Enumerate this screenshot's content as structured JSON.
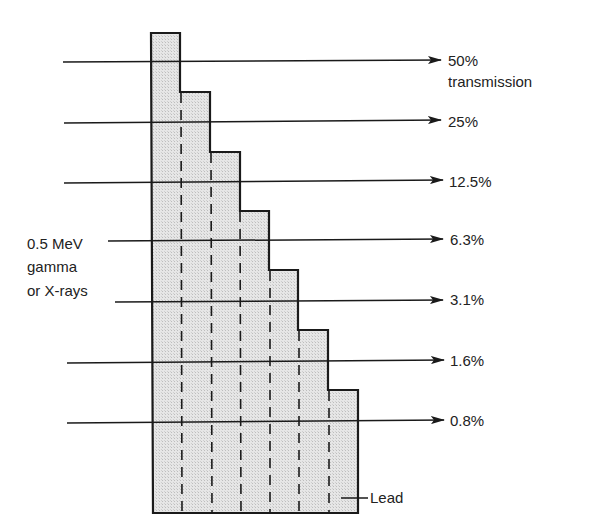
{
  "diagram": {
    "source_label": [
      "0.5 MeV",
      "gamma",
      "or X-rays"
    ],
    "material_label": "Lead",
    "transmission_word": "transmission",
    "levels": [
      {
        "label": "50%",
        "y": 62,
        "x_start": 63,
        "steps_crossed": 1
      },
      {
        "label": "25%",
        "y": 122,
        "x_start": 64,
        "steps_crossed": 2
      },
      {
        "label": "12.5%",
        "y": 182,
        "x_start": 64,
        "steps_crossed": 3
      },
      {
        "label": "6.3%",
        "y": 240,
        "x_start": 108,
        "steps_crossed": 4
      },
      {
        "label": "3.1%",
        "y": 300,
        "x_start": 115,
        "steps_crossed": 5
      },
      {
        "label": "1.6%",
        "y": 361,
        "x_start": 67,
        "steps_crossed": 6
      },
      {
        "label": "0.8%",
        "y": 421,
        "x_start": 67,
        "steps_crossed": 7
      }
    ],
    "colors": {
      "fill": "#e4e4e4",
      "stroke": "#1a1a1a",
      "text": "#222222"
    }
  }
}
